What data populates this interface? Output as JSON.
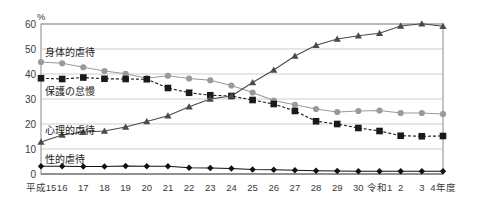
{
  "chart_data": {
    "type": "line",
    "title": "",
    "xlabel": "",
    "ylabel": "%",
    "unit_label": "%",
    "ylim": [
      0,
      60
    ],
    "ytick_step": 10,
    "yticks": [
      "0",
      "10",
      "20",
      "30",
      "40",
      "50",
      "60"
    ],
    "grid": true,
    "legend": "inline-labels",
    "x_axis_suffix": "4年度",
    "categories": [
      "平成15",
      "16",
      "17",
      "18",
      "19",
      "20",
      "21",
      "22",
      "23",
      "24",
      "25",
      "26",
      "27",
      "28",
      "29",
      "30",
      "令和1",
      "2",
      "3",
      "4年度"
    ],
    "series": [
      {
        "name": "身体的虐待",
        "marker": "circle",
        "color": "#9a9a9a",
        "line": "solid",
        "values": [
          44.8,
          44.3,
          42.7,
          41.2,
          40.1,
          38.3,
          39.3,
          38.2,
          37.5,
          35.4,
          32.6,
          29.4,
          27.7,
          26.0,
          24.8,
          25.2,
          25.4,
          24.4,
          24.4,
          24.0
        ]
      },
      {
        "name": "保護の怠慢",
        "marker": "square",
        "color": "#1a1a1a",
        "line": "dashed",
        "values": [
          38.3,
          38.0,
          38.6,
          38.1,
          38.0,
          37.9,
          34.4,
          32.5,
          31.5,
          31.2,
          29.6,
          28.0,
          25.2,
          21.1,
          20.0,
          18.4,
          17.2,
          15.3,
          15.1,
          15.2
        ]
      },
      {
        "name": "心理的虐待",
        "marker": "triangle",
        "color": "#4a4a4a",
        "line": "solid",
        "values": [
          12.8,
          15.6,
          16.8,
          17.2,
          18.8,
          21.0,
          23.3,
          26.9,
          30.0,
          31.2,
          36.6,
          41.6,
          47.2,
          51.5,
          54.0,
          55.3,
          56.3,
          59.2,
          60.1,
          59.1
        ]
      },
      {
        "name": "性的虐待",
        "marker": "diamond",
        "color": "#111111",
        "line": "solid",
        "values": [
          3.1,
          3.1,
          3.0,
          3.0,
          3.2,
          3.1,
          3.1,
          2.5,
          2.4,
          2.2,
          1.8,
          1.7,
          1.5,
          1.3,
          1.2,
          1.1,
          1.1,
          1.1,
          1.1,
          1.1
        ]
      }
    ]
  }
}
